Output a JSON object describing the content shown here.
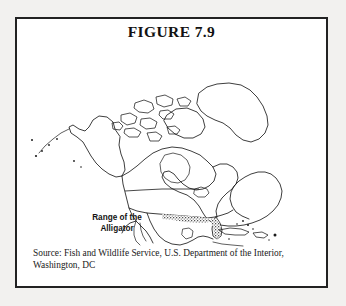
{
  "figure": {
    "title": "FIGURE 7.9",
    "source_line_1": "Source: Fish and Wildlife Service, U.S. Department of the Interior,",
    "source_line_2": "Washington, DC"
  },
  "map": {
    "range_label_line_1": "Range of the",
    "range_label_line_2": "Alligator",
    "region_depicted": "North America",
    "shaded_region": "Alligator range — U.S. Gulf Coast and Florida",
    "features": [
      "Alaska",
      "Aleutian Islands",
      "Canada",
      "Canadian Arctic Archipelago",
      "Greenland",
      "Hudson Bay",
      "Baffin Island",
      "United States",
      "United States–Canada border",
      "Baja California",
      "Gulf of California",
      "Mexico",
      "Gulf of Mexico",
      "Florida",
      "Cuba",
      "Hispaniola",
      "Puerto Rico",
      "Central America"
    ]
  },
  "colors": {
    "page_background": "#f2f1ef",
    "frame_background": "#ffffff",
    "frame_border": "#222222",
    "ink": "#1b1b1b",
    "text": "#121212"
  }
}
